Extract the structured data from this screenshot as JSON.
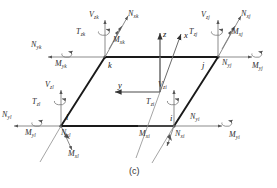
{
  "figure": {
    "caption": "(c)",
    "stroke_color": "#222222",
    "thin_color": "#8a8a8a",
    "plate_edge_color": "#1a1a1a"
  },
  "axes": [
    {
      "name": "z-axis",
      "label": "z"
    },
    {
      "name": "x-axis",
      "label": "x"
    },
    {
      "name": "y-axis",
      "label": "y"
    }
  ],
  "nodes": [
    {
      "id": "k",
      "label": "k"
    },
    {
      "id": "j",
      "label": "j"
    },
    {
      "id": "l",
      "label": "l"
    },
    {
      "id": "i",
      "label": "i"
    }
  ],
  "labels": {
    "k": {
      "Vzk": {
        "base": "V",
        "sub": "zk"
      },
      "Tzk": {
        "base": "T",
        "sub": "zk"
      },
      "Nxk": {
        "base": "N",
        "sub": "xk"
      },
      "Mxk": {
        "base": "M",
        "sub": "xk"
      },
      "Nyk": {
        "base": "N",
        "sub": "yk"
      },
      "Myk": {
        "base": "M",
        "sub": "yk"
      }
    },
    "j": {
      "Vzj": {
        "base": "V",
        "sub": "zj"
      },
      "Tzj": {
        "base": "T",
        "sub": "zj"
      },
      "Nxj": {
        "base": "N",
        "sub": "xj"
      },
      "Mxj": {
        "base": "M",
        "sub": "xj"
      },
      "Nyj": {
        "base": "N",
        "sub": "yj"
      },
      "Myj": {
        "base": "M",
        "sub": "yj"
      }
    },
    "l": {
      "Vzl": {
        "base": "V",
        "sub": "zl"
      },
      "Tzl": {
        "base": "T",
        "sub": "zl"
      },
      "Nyl": {
        "base": "N",
        "sub": "yl"
      },
      "Myl": {
        "base": "M",
        "sub": "yl"
      },
      "Nxl": {
        "base": "N",
        "sub": "xl"
      },
      "Mxl": {
        "base": "M",
        "sub": "xl"
      }
    },
    "i": {
      "Vzi": {
        "base": "V",
        "sub": "zi"
      },
      "Tzi": {
        "base": "T",
        "sub": "zi"
      },
      "Nyi": {
        "base": "N",
        "sub": "yi"
      },
      "Myi": {
        "base": "M",
        "sub": "yi"
      },
      "Nxi": {
        "base": "N",
        "sub": "xi"
      },
      "Mxi": {
        "base": "M",
        "sub": "xi"
      }
    }
  }
}
